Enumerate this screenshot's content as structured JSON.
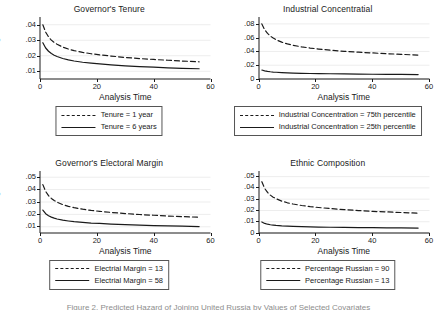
{
  "figure": {
    "layout": "2x2 grid of small-multiple hazard plots",
    "bottom_caption": "Figure 2. Predicted Hazard of Joining United Russia by Values of Selected Covariates"
  },
  "chart_data": [
    {
      "id": "governors-tenure",
      "type": "line",
      "title": "Governor's Tenure",
      "xlabel": "Analysis Time",
      "ylabel": "Hazard Function\nof Joining UR",
      "xlim": [
        0,
        60
      ],
      "ylim": [
        0.005,
        0.045
      ],
      "xticks": [
        0,
        20,
        40,
        60
      ],
      "xtick_labels": [
        "0",
        "20",
        "40",
        "60"
      ],
      "yticks": [
        0.01,
        0.02,
        0.03,
        0.04
      ],
      "ytick_labels": [
        ".01",
        ".02",
        ".03",
        ".04"
      ],
      "grid": true,
      "legend_position": "below",
      "series": [
        {
          "name": "Tenure = 1 year",
          "style": "dashed",
          "x": [
            1,
            2,
            3,
            4,
            5,
            6,
            8,
            10,
            12,
            15,
            18,
            21,
            25,
            30,
            35,
            40,
            45,
            50,
            56
          ],
          "y": [
            0.04,
            0.0352,
            0.0322,
            0.0301,
            0.0286,
            0.0274,
            0.0256,
            0.0243,
            0.0233,
            0.0222,
            0.0213,
            0.0206,
            0.0198,
            0.0189,
            0.0182,
            0.0176,
            0.0171,
            0.0166,
            0.0161
          ]
        },
        {
          "name": "Tenure = 6 years",
          "style": "solid",
          "x": [
            1,
            2,
            3,
            4,
            5,
            6,
            8,
            10,
            12,
            15,
            18,
            21,
            25,
            30,
            35,
            40,
            45,
            50,
            56
          ],
          "y": [
            0.0284,
            0.025,
            0.0229,
            0.0214,
            0.0203,
            0.0195,
            0.0182,
            0.0173,
            0.0166,
            0.0158,
            0.0152,
            0.0147,
            0.0141,
            0.0135,
            0.013,
            0.0126,
            0.0122,
            0.0119,
            0.0116
          ]
        }
      ]
    },
    {
      "id": "industrial-concentration",
      "type": "line",
      "title": "Industrial Concentratial",
      "xlabel": "Analysis Time",
      "ylabel": "",
      "xlim": [
        0,
        60
      ],
      "ylim": [
        0,
        0.09
      ],
      "xticks": [
        0,
        20,
        40,
        60
      ],
      "xtick_labels": [
        "0",
        "20",
        "40",
        "60"
      ],
      "yticks": [
        0,
        0.02,
        0.04,
        0.06,
        0.08
      ],
      "ytick_labels": [
        "0",
        ".02",
        ".04",
        ".06",
        ".08"
      ],
      "grid": true,
      "legend_position": "below",
      "series": [
        {
          "name": "Industrial Concentration = 75th percentile",
          "style": "dashed",
          "x": [
            1,
            2,
            3,
            4,
            5,
            6,
            8,
            10,
            12,
            15,
            18,
            21,
            25,
            30,
            35,
            40,
            45,
            50,
            56
          ],
          "y": [
            0.08,
            0.0715,
            0.0662,
            0.0623,
            0.0594,
            0.057,
            0.0535,
            0.0509,
            0.0489,
            0.0466,
            0.0449,
            0.0435,
            0.0419,
            0.0402,
            0.0389,
            0.0378,
            0.0367,
            0.0358,
            0.0347
          ]
        },
        {
          "name": "Industrial Concentration = 25th percentile",
          "style": "solid",
          "x": [
            1,
            2,
            3,
            4,
            5,
            6,
            8,
            10,
            12,
            15,
            18,
            21,
            25,
            30,
            35,
            40,
            45,
            50,
            56
          ],
          "y": [
            0.013,
            0.0118,
            0.011,
            0.0105,
            0.0101,
            0.0098,
            0.0093,
            0.0089,
            0.0086,
            0.0083,
            0.008,
            0.0078,
            0.0076,
            0.0073,
            0.0071,
            0.0069,
            0.0068,
            0.0066,
            0.0064
          ]
        }
      ]
    },
    {
      "id": "governors-electoral-margin",
      "type": "line",
      "title": "Governor's Electoral Margin",
      "xlabel": "Analysis Time",
      "ylabel": "Hazard Function\nof Joining UR",
      "xlim": [
        0,
        60
      ],
      "ylim": [
        0.005,
        0.055
      ],
      "xticks": [
        0,
        20,
        40,
        60
      ],
      "xtick_labels": [
        "0",
        "20",
        "40",
        "60"
      ],
      "yticks": [
        0.01,
        0.02,
        0.03,
        0.04,
        0.05
      ],
      "ytick_labels": [
        ".01",
        ".02",
        ".03",
        ".04",
        ".05"
      ],
      "grid": true,
      "legend_position": "below",
      "series": [
        {
          "name": "Electrial Margin = 13",
          "style": "dashed",
          "x": [
            1,
            2,
            3,
            4,
            5,
            6,
            8,
            10,
            12,
            15,
            18,
            21,
            25,
            30,
            35,
            40,
            45,
            50,
            56
          ],
          "y": [
            0.044,
            0.0385,
            0.0351,
            0.0329,
            0.0312,
            0.0299,
            0.0279,
            0.0265,
            0.0254,
            0.0242,
            0.0232,
            0.0225,
            0.0216,
            0.0207,
            0.0199,
            0.0193,
            0.0187,
            0.0182,
            0.0177
          ]
        },
        {
          "name": "Electrial Margin = 58",
          "style": "solid",
          "x": [
            1,
            2,
            3,
            4,
            5,
            6,
            8,
            10,
            12,
            15,
            18,
            21,
            25,
            30,
            35,
            40,
            45,
            50,
            56
          ],
          "y": [
            0.0235,
            0.0206,
            0.0189,
            0.0178,
            0.017,
            0.0163,
            0.0154,
            0.0147,
            0.0141,
            0.0135,
            0.013,
            0.0127,
            0.0122,
            0.0117,
            0.0113,
            0.011,
            0.0107,
            0.0105,
            0.0102
          ]
        }
      ]
    },
    {
      "id": "ethnic-composition",
      "type": "line",
      "title": "Ethnic Composition",
      "xlabel": "Analysis Time",
      "ylabel": "",
      "xlim": [
        0,
        60
      ],
      "ylim": [
        0,
        0.055
      ],
      "xticks": [
        0,
        20,
        40,
        60
      ],
      "xtick_labels": [
        "0",
        "20",
        "40",
        "60"
      ],
      "yticks": [
        0,
        0.01,
        0.02,
        0.03,
        0.04,
        0.05
      ],
      "ytick_labels": [
        "0",
        ".01",
        ".02",
        ".03",
        ".04",
        ".05"
      ],
      "grid": true,
      "legend_position": "below",
      "series": [
        {
          "name": "Percentage Russian = 90",
          "style": "dashed",
          "x": [
            1,
            2,
            3,
            4,
            5,
            6,
            8,
            10,
            12,
            15,
            18,
            21,
            25,
            30,
            35,
            40,
            45,
            50,
            56
          ],
          "y": [
            0.0455,
            0.0395,
            0.036,
            0.0336,
            0.0318,
            0.0304,
            0.0283,
            0.0268,
            0.0257,
            0.0244,
            0.0234,
            0.0226,
            0.0217,
            0.0207,
            0.0199,
            0.0192,
            0.0187,
            0.0182,
            0.0176
          ]
        },
        {
          "name": "Percentage Russian = 13",
          "style": "solid",
          "x": [
            1,
            2,
            3,
            4,
            5,
            6,
            8,
            10,
            12,
            15,
            18,
            21,
            25,
            30,
            35,
            40,
            45,
            50,
            56
          ],
          "y": [
            0.0098,
            0.0085,
            0.0078,
            0.0073,
            0.007,
            0.0067,
            0.0063,
            0.0061,
            0.0059,
            0.0056,
            0.0054,
            0.0053,
            0.0051,
            0.005,
            0.0048,
            0.0047,
            0.0046,
            0.0045,
            0.0044
          ]
        }
      ]
    }
  ]
}
